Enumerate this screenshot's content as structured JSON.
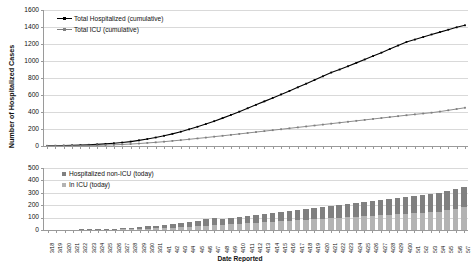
{
  "axis_title_y": "Number of Hospitalized Cases",
  "axis_title_x": "Date Reported",
  "colors": {
    "line_total": "#000000",
    "line_icu": "#7f7f7f",
    "bar_non_icu": "#808080",
    "bar_icu": "#b3b3b3",
    "gridline": "#d9d9d9",
    "axis": "#9a9a9a"
  },
  "top_legend": {
    "items": [
      {
        "label": "Total Hospitalized (cumulative)"
      },
      {
        "label": "Total ICU (cumulative)"
      }
    ]
  },
  "bottom_legend": {
    "items": [
      {
        "label": "Hospitalized non-ICU (today)"
      },
      {
        "label": "In ICU (today)"
      }
    ]
  },
  "top_yticks": [
    "0",
    "200",
    "400",
    "600",
    "800",
    "1000",
    "1200",
    "1400",
    "1600"
  ],
  "bottom_yticks": [
    "0",
    "100",
    "200",
    "300",
    "400",
    "500"
  ],
  "chart_data": [
    {
      "type": "line",
      "title": "",
      "xlabel": "Date Reported",
      "ylabel": "Number of Hospitalized Cases",
      "ylim": [
        0,
        1600
      ],
      "ytick_step": 200,
      "grid": true,
      "legend_position": "top-left",
      "x": [
        "3/18",
        "3/19",
        "3/20",
        "3/21",
        "3/22",
        "3/23",
        "3/24",
        "3/25",
        "3/26",
        "3/27",
        "3/28",
        "3/29",
        "3/30",
        "3/31",
        "4/1",
        "4/2",
        "4/3",
        "4/4",
        "4/5",
        "4/6",
        "4/7",
        "4/8",
        "4/9",
        "4/10",
        "4/11",
        "4/12",
        "4/13",
        "4/14",
        "4/15",
        "4/16",
        "4/17",
        "4/18",
        "4/19",
        "4/20",
        "4/21",
        "4/22",
        "4/23",
        "4/24",
        "4/25",
        "4/26",
        "4/27",
        "4/28",
        "4/29",
        "4/30",
        "5/1",
        "5/2",
        "5/3",
        "5/4",
        "5/5",
        "5/6",
        "5/7"
      ],
      "series": [
        {
          "name": "Total Hospitalized (cumulative)",
          "values": [
            2,
            3,
            5,
            7,
            10,
            14,
            19,
            25,
            32,
            41,
            52,
            66,
            82,
            100,
            120,
            143,
            168,
            196,
            226,
            258,
            292,
            328,
            366,
            404,
            444,
            484,
            525,
            566,
            607,
            648,
            690,
            733,
            776,
            820,
            864,
            900,
            938,
            978,
            1018,
            1058,
            1098,
            1140,
            1182,
            1224,
            1252,
            1282,
            1312,
            1340,
            1368,
            1396,
            1420
          ]
        },
        {
          "name": "Total ICU (cumulative)",
          "values": [
            1,
            1,
            2,
            3,
            4,
            6,
            8,
            11,
            14,
            18,
            23,
            29,
            36,
            43,
            51,
            60,
            69,
            79,
            89,
            99,
            110,
            120,
            131,
            142,
            153,
            164,
            175,
            186,
            197,
            208,
            219,
            230,
            241,
            252,
            263,
            274,
            285,
            296,
            307,
            318,
            329,
            340,
            351,
            362,
            372,
            382,
            392,
            405,
            420,
            435,
            450
          ]
        }
      ]
    },
    {
      "type": "bar",
      "stacked": true,
      "title": "",
      "xlabel": "Date Reported",
      "ylabel": "Number of Hospitalized Cases",
      "ylim": [
        0,
        500
      ],
      "ytick_step": 100,
      "grid": true,
      "legend_position": "top-left",
      "categories": [
        "3/18",
        "3/19",
        "3/20",
        "3/21",
        "3/22",
        "3/23",
        "3/24",
        "3/25",
        "3/26",
        "3/27",
        "3/28",
        "3/29",
        "3/30",
        "3/31",
        "4/1",
        "4/2",
        "4/3",
        "4/4",
        "4/5",
        "4/6",
        "4/7",
        "4/8",
        "4/9",
        "4/10",
        "4/11",
        "4/12",
        "4/13",
        "4/14",
        "4/15",
        "4/16",
        "4/17",
        "4/18",
        "4/19",
        "4/20",
        "4/21",
        "4/22",
        "4/23",
        "4/24",
        "4/25",
        "4/26",
        "4/27",
        "4/28",
        "4/29",
        "4/30",
        "5/1",
        "5/2",
        "5/3",
        "5/4",
        "5/5",
        "5/6",
        "5/7"
      ],
      "series": [
        {
          "name": "Hospitalized non-ICU (today)",
          "values": [
            1,
            1,
            2,
            2,
            3,
            4,
            5,
            6,
            7,
            9,
            11,
            14,
            17,
            20,
            24,
            28,
            33,
            38,
            44,
            50,
            56,
            48,
            52,
            58,
            62,
            66,
            70,
            74,
            78,
            82,
            86,
            90,
            94,
            98,
            102,
            106,
            110,
            114,
            118,
            122,
            126,
            130,
            134,
            138,
            142,
            146,
            150,
            154,
            158,
            162,
            166
          ]
        },
        {
          "name": "In ICU (today)",
          "values": [
            0,
            1,
            1,
            1,
            2,
            2,
            3,
            4,
            5,
            6,
            8,
            10,
            12,
            14,
            17,
            20,
            23,
            27,
            31,
            35,
            39,
            42,
            46,
            50,
            54,
            58,
            62,
            66,
            70,
            74,
            78,
            82,
            86,
            90,
            94,
            98,
            102,
            106,
            110,
            114,
            118,
            122,
            126,
            130,
            134,
            138,
            142,
            148,
            160,
            172,
            184
          ]
        }
      ]
    }
  ]
}
